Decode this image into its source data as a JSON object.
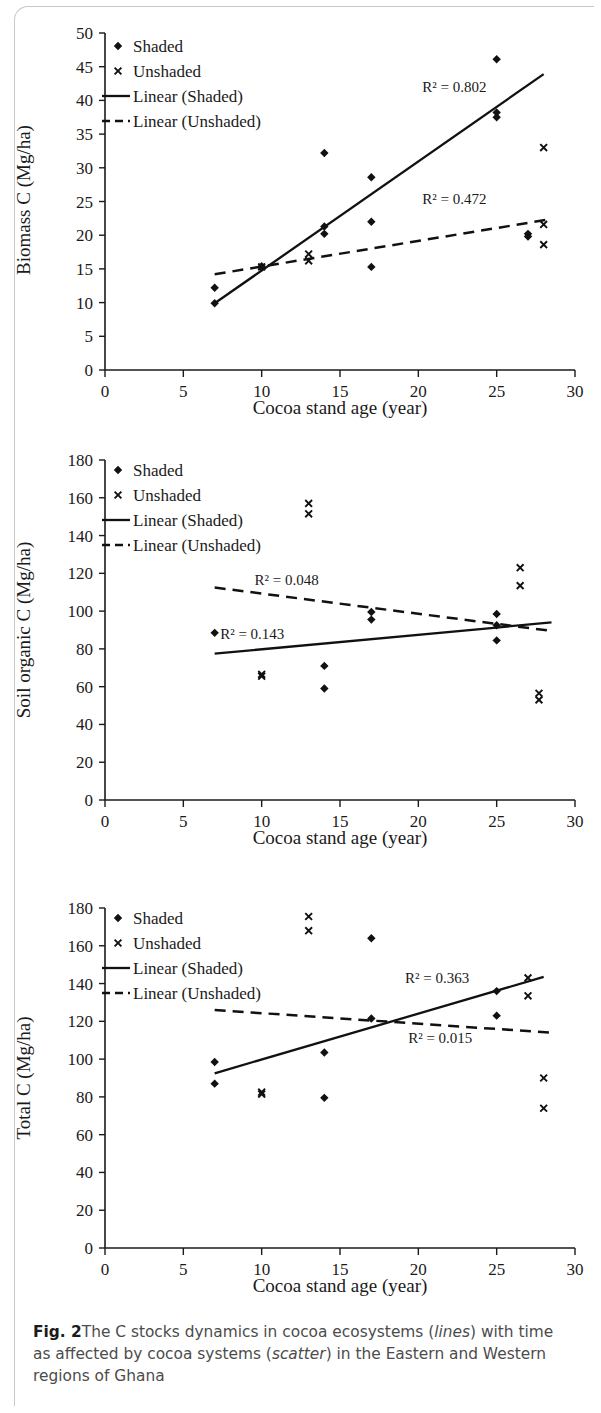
{
  "figure": {
    "label": "Fig. 2",
    "caption_parts": [
      "The C stocks dynamics in cocoa ecosystems (",
      "lines",
      ") with time as affected by cocoa systems (",
      "scatter",
      ") in the Eastern and Western regions of Ghana"
    ],
    "caption_full": "Fig. 2 The C stocks dynamics in cocoa ecosystems (lines) with time as affected by cocoa systems (scatter) in the Eastern and Western regions of Ghana"
  },
  "colors": {
    "ink": "#111111",
    "caption_text": "#4c4c4c",
    "page_rule": "#c9c9c9",
    "background": "#ffffff"
  },
  "legend_common": {
    "items": [
      {
        "label": "Shaded",
        "marker": "diamond-marker"
      },
      {
        "label": "Unshaded",
        "marker": "x-marker"
      },
      {
        "label": "Linear (Shaded)",
        "marker": "solid-line-swatch"
      },
      {
        "label": "Linear (Unshaded)",
        "marker": "dashed-line-swatch"
      }
    ]
  },
  "chart_data": [
    {
      "id": "biomass-c",
      "type": "scatter",
      "title": "",
      "xlabel": "Cocoa stand age (year)",
      "ylabel": "Biomass  C (Mg/ha)",
      "xlim": [
        0,
        30
      ],
      "ylim": [
        0,
        50
      ],
      "xticks": [
        0,
        5,
        10,
        15,
        20,
        25,
        30
      ],
      "yticks": [
        0,
        5,
        10,
        15,
        20,
        25,
        30,
        35,
        40,
        45,
        50
      ],
      "grid": false,
      "legend_position": "top-left",
      "series": [
        {
          "name": "Shaded",
          "marker": "diamond",
          "points": [
            [
              7,
              9.9
            ],
            [
              7,
              12.2
            ],
            [
              10,
              15.2
            ],
            [
              10,
              15.4
            ],
            [
              14,
              32.2
            ],
            [
              14,
              20.2
            ],
            [
              14,
              21.3
            ],
            [
              17,
              28.6
            ],
            [
              17,
              22.0
            ],
            [
              17,
              15.3
            ],
            [
              25,
              46.1
            ],
            [
              25,
              37.5
            ],
            [
              25,
              38.2
            ],
            [
              27,
              19.8
            ],
            [
              27,
              20.2
            ]
          ]
        },
        {
          "name": "Unshaded",
          "marker": "x",
          "points": [
            [
              10,
              15.3
            ],
            [
              13,
              17.2
            ],
            [
              13,
              16.2
            ],
            [
              28,
              33.0
            ],
            [
              28,
              21.6
            ],
            [
              28,
              18.6
            ]
          ]
        }
      ],
      "fits": [
        {
          "name": "Linear (Shaded)",
          "style": "solid",
          "x_from": 7,
          "x_to": 28,
          "y_from": 9.9,
          "y_to": 43.9,
          "r2_text": "R² = 0.802",
          "r2_value": 0.802,
          "r2_x": 22.3,
          "r2_y": 41.2
        },
        {
          "name": "Linear (Unshaded)",
          "style": "dashed",
          "x_from": 7,
          "x_to": 28.5,
          "y_from": 14.2,
          "y_to": 22.4,
          "r2_text": "R² = 0.472",
          "r2_value": 0.472,
          "r2_x": 22.3,
          "r2_y": 24.6
        }
      ]
    },
    {
      "id": "soil-organic-c",
      "type": "scatter",
      "title": "",
      "xlabel": "Cocoa stand age (year)",
      "ylabel": "Soil organic C (Mg/ha)",
      "xlim": [
        0,
        30
      ],
      "ylim": [
        0,
        180
      ],
      "xticks": [
        0,
        5,
        10,
        15,
        20,
        25,
        30
      ],
      "yticks": [
        0,
        20,
        40,
        60,
        80,
        100,
        120,
        140,
        160,
        180
      ],
      "grid": false,
      "legend_position": "top-left",
      "series": [
        {
          "name": "Shaded",
          "marker": "diamond",
          "points": [
            [
              7,
              88.5
            ],
            [
              14,
              71.0
            ],
            [
              14,
              59.0
            ],
            [
              17,
              99.5
            ],
            [
              17,
              95.5
            ],
            [
              25,
              98.5
            ],
            [
              25,
              92.5
            ],
            [
              25,
              84.5
            ]
          ]
        },
        {
          "name": "Unshaded",
          "marker": "x",
          "points": [
            [
              10,
              66.5
            ],
            [
              10,
              65.5
            ],
            [
              13,
              157.0
            ],
            [
              13,
              151.5
            ],
            [
              26.5,
              123.0
            ],
            [
              26.5,
              113.5
            ],
            [
              27.7,
              56.5
            ],
            [
              27.7,
              53.0
            ]
          ]
        }
      ],
      "fits": [
        {
          "name": "Linear (Shaded)",
          "style": "solid",
          "x_from": 7,
          "x_to": 28.5,
          "y_from": 77.5,
          "y_to": 94.0,
          "r2_text": "R² = 0.143",
          "r2_value": 0.143,
          "r2_x": 9.4,
          "r2_y": 85.5
        },
        {
          "name": "Linear (Unshaded)",
          "style": "dashed",
          "x_from": 7,
          "x_to": 28.5,
          "y_from": 112.5,
          "y_to": 89.5,
          "r2_text": "R² = 0.048",
          "r2_value": 0.048,
          "r2_x": 11.6,
          "r2_y": 114.0
        }
      ]
    },
    {
      "id": "total-c",
      "type": "scatter",
      "title": "",
      "xlabel": "Cocoa stand age (year)",
      "ylabel": "Total C (Mg/ha)",
      "xlim": [
        0,
        30
      ],
      "ylim": [
        0,
        180
      ],
      "xticks": [
        0,
        5,
        10,
        15,
        20,
        25,
        30
      ],
      "yticks": [
        0,
        20,
        40,
        60,
        80,
        100,
        120,
        140,
        160,
        180
      ],
      "grid": false,
      "legend_position": "top-left",
      "series": [
        {
          "name": "Shaded",
          "marker": "diamond",
          "points": [
            [
              7,
              98.5
            ],
            [
              7,
              87.0
            ],
            [
              14,
              103.5
            ],
            [
              14,
              79.5
            ],
            [
              17,
              164.0
            ],
            [
              17,
              121.5
            ],
            [
              25,
              136.0
            ],
            [
              25,
              123.0
            ]
          ]
        },
        {
          "name": "Unshaded",
          "marker": "x",
          "points": [
            [
              10,
              82.5
            ],
            [
              10,
              81.5
            ],
            [
              13,
              175.5
            ],
            [
              13,
              168.0
            ],
            [
              27,
              143.0
            ],
            [
              27,
              133.5
            ],
            [
              28,
              90.0
            ],
            [
              28,
              74.0
            ]
          ]
        }
      ],
      "fits": [
        {
          "name": "Linear (Shaded)",
          "style": "solid",
          "x_from": 7,
          "x_to": 28,
          "y_from": 92.5,
          "y_to": 143.5,
          "r2_text": "R² = 0.363",
          "r2_value": 0.363,
          "r2_x": 21.2,
          "r2_y": 140.5
        },
        {
          "name": "Linear (Unshaded)",
          "style": "dashed",
          "x_from": 7,
          "x_to": 28.5,
          "y_from": 126.0,
          "y_to": 114.0,
          "r2_text": "R² = 0.015",
          "r2_value": 0.015,
          "r2_x": 21.4,
          "r2_y": 108.5
        }
      ]
    }
  ]
}
